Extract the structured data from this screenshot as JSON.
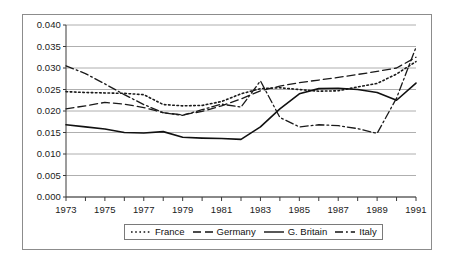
{
  "chart_data": {
    "type": "line",
    "title": "",
    "subtitle": "",
    "xlabel": "",
    "ylabel": "",
    "xlim": [
      1973,
      1991
    ],
    "ylim": [
      0.0,
      0.04
    ],
    "grid": true,
    "grid_axis": "y",
    "legend_position": "bottom",
    "y_ticks": [
      "0.040",
      "0.035",
      "0.030",
      "0.025",
      "0.020",
      "0.015",
      "0.010",
      "0.005",
      "0.000"
    ],
    "y_tick_values": [
      0.04,
      0.035,
      0.03,
      0.025,
      0.02,
      0.015,
      0.01,
      0.005,
      0.0
    ],
    "x_tick_labels": [
      "1973",
      "1975",
      "1977",
      "1979",
      "1981",
      "1983",
      "1985",
      "1987",
      "1989",
      "1991"
    ],
    "x_tick_values": [
      1973,
      1975,
      1977,
      1979,
      1981,
      1983,
      1985,
      1987,
      1989,
      1991
    ],
    "x": [
      1973,
      1974,
      1975,
      1976,
      1977,
      1978,
      1979,
      1980,
      1981,
      1982,
      1983,
      1984,
      1985,
      1986,
      1987,
      1988,
      1989,
      1990,
      1991
    ],
    "series": [
      {
        "name": "France",
        "style": "dotted",
        "color": "#1a1a1a",
        "values": [
          0.0245,
          0.0243,
          0.0242,
          0.0241,
          0.0238,
          0.0215,
          0.0212,
          0.0213,
          0.0222,
          0.024,
          0.0252,
          0.0254,
          0.025,
          0.0246,
          0.0247,
          0.0256,
          0.0264,
          0.0286,
          0.0315
        ]
      },
      {
        "name": "Germany",
        "style": "dashed",
        "color": "#1a1a1a",
        "values": [
          0.0205,
          0.0212,
          0.022,
          0.0216,
          0.0208,
          0.0196,
          0.0191,
          0.0199,
          0.0212,
          0.0228,
          0.0247,
          0.0258,
          0.0266,
          0.0272,
          0.0278,
          0.0285,
          0.0292,
          0.03,
          0.0325
        ]
      },
      {
        "name": "G. Britain",
        "style": "solid",
        "color": "#111111",
        "values": [
          0.0168,
          0.0163,
          0.0158,
          0.015,
          0.0149,
          0.0152,
          0.0139,
          0.0137,
          0.0136,
          0.0134,
          0.0163,
          0.0205,
          0.024,
          0.0252,
          0.0253,
          0.025,
          0.0243,
          0.0225,
          0.0265
        ]
      },
      {
        "name": "Italy",
        "style": "dashdot",
        "color": "#1a1a1a",
        "values": [
          0.0305,
          0.0287,
          0.0263,
          0.0238,
          0.0215,
          0.0196,
          0.019,
          0.0203,
          0.0216,
          0.0209,
          0.027,
          0.0185,
          0.0163,
          0.0168,
          0.0166,
          0.0159,
          0.0148,
          0.023,
          0.0348
        ]
      }
    ]
  },
  "legend": {
    "items": [
      {
        "label": "France",
        "style": "dotted"
      },
      {
        "label": "Germany",
        "style": "dashed"
      },
      {
        "label": "G. Britain",
        "style": "solid"
      },
      {
        "label": "Italy",
        "style": "dashdot"
      }
    ]
  }
}
